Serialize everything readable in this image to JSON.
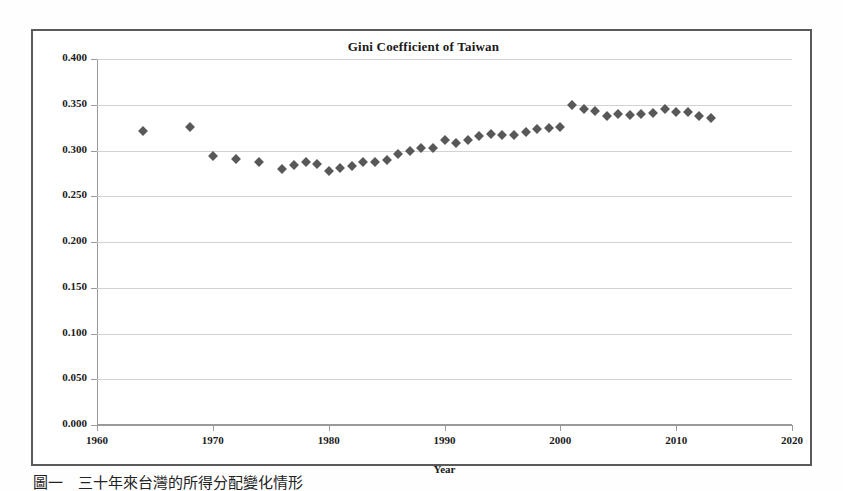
{
  "figure": {
    "caption": "圖一　三十年來台灣的所得分配變化情形"
  },
  "chart_data": {
    "type": "scatter",
    "title": "Gini Coefficient of Taiwan",
    "xlabel": "Year",
    "ylabel": "",
    "xlim": [
      1960,
      2020
    ],
    "ylim": [
      0.0,
      0.4
    ],
    "xticks": [
      "1960",
      "1970",
      "1980",
      "1990",
      "2000",
      "2010",
      "2020"
    ],
    "xtick_values": [
      1960,
      1970,
      1980,
      1990,
      2000,
      2010,
      2020
    ],
    "yticks": [
      "0.000",
      "0.050",
      "0.100",
      "0.150",
      "0.200",
      "0.250",
      "0.300",
      "0.350",
      "0.400"
    ],
    "ytick_values": [
      0.0,
      0.05,
      0.1,
      0.15,
      0.2,
      0.25,
      0.3,
      0.35,
      0.4
    ],
    "grid": "horizontal",
    "legend": "none",
    "marker": "diamond",
    "marker_color": "#585858",
    "x": [
      1964,
      1968,
      1970,
      1972,
      1974,
      1976,
      1977,
      1978,
      1979,
      1980,
      1981,
      1982,
      1983,
      1984,
      1985,
      1986,
      1987,
      1988,
      1989,
      1990,
      1991,
      1992,
      1993,
      1994,
      1995,
      1996,
      1997,
      1998,
      1999,
      2000,
      2001,
      2002,
      2003,
      2004,
      2005,
      2006,
      2007,
      2008,
      2009,
      2010,
      2011,
      2012,
      2013
    ],
    "values": [
      0.321,
      0.326,
      0.294,
      0.291,
      0.287,
      0.28,
      0.284,
      0.287,
      0.285,
      0.278,
      0.281,
      0.283,
      0.287,
      0.287,
      0.29,
      0.296,
      0.299,
      0.303,
      0.303,
      0.312,
      0.308,
      0.312,
      0.316,
      0.318,
      0.317,
      0.317,
      0.32,
      0.324,
      0.325,
      0.326,
      0.35,
      0.345,
      0.343,
      0.338,
      0.34,
      0.339,
      0.34,
      0.341,
      0.345,
      0.342,
      0.342,
      0.338,
      0.336
    ]
  }
}
